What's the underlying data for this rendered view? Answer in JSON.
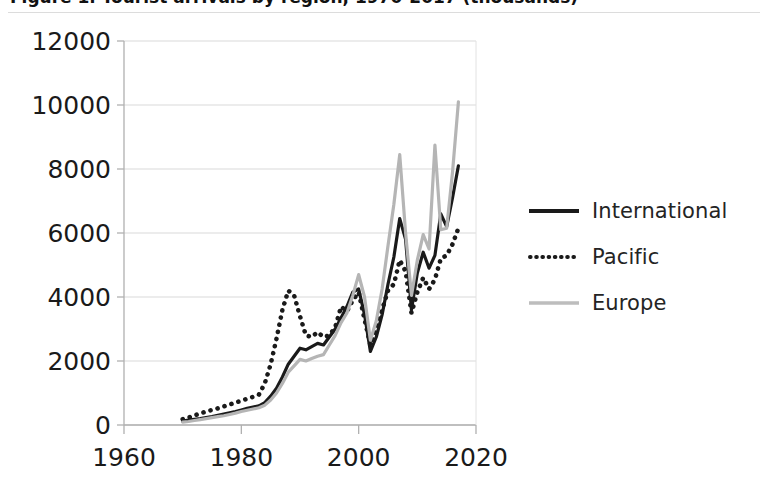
{
  "figure": {
    "title_clipped": "Figure 1. Tourist arrivals by region, 1970-2017 (thousands)",
    "background": "#ffffff"
  },
  "legend": {
    "position": "right",
    "items": [
      {
        "label": "International",
        "style": "solid",
        "color": "#1a1a1a",
        "icon": "solid-line-icon"
      },
      {
        "label": "Pacific",
        "style": "dotted",
        "color": "#1a1a1a",
        "icon": "dotted-line-icon"
      },
      {
        "label": "Europe",
        "style": "solid",
        "color": "#b5b5b5",
        "icon": "gray-line-icon"
      }
    ]
  },
  "axes": {
    "y_ticks": [
      "0",
      "2000",
      "4000",
      "6000",
      "8000",
      "10000",
      "12000"
    ],
    "x_ticks": [
      "1960",
      "1980",
      "2000",
      "2020"
    ],
    "y_tick_label_size": 25,
    "x_tick_label_size": 25,
    "grid": true,
    "grid_color": "#d9d9d9",
    "axis_color": "#b0b0b0"
  },
  "chart_data": {
    "type": "line",
    "title": "Figure 1. Tourist arrivals by region, 1970-2017 (thousands)",
    "xlabel": "",
    "ylabel": "",
    "xlim": [
      1960,
      2020
    ],
    "ylim": [
      0,
      12000
    ],
    "xticks": [
      1960,
      1980,
      2000,
      2020
    ],
    "yticks": [
      0,
      2000,
      4000,
      6000,
      8000,
      10000,
      12000
    ],
    "grid": "horizontal",
    "legend_position": "right",
    "x": [
      1970,
      1971,
      1972,
      1973,
      1974,
      1975,
      1976,
      1977,
      1978,
      1979,
      1980,
      1981,
      1982,
      1983,
      1984,
      1985,
      1986,
      1987,
      1988,
      1989,
      1990,
      1991,
      1992,
      1993,
      1994,
      1995,
      1996,
      1997,
      1998,
      1999,
      2000,
      2001,
      2002,
      2003,
      2004,
      2005,
      2006,
      2007,
      2008,
      2009,
      2010,
      2011,
      2012,
      2013,
      2014,
      2015,
      2016,
      2017
    ],
    "series": [
      {
        "name": "International",
        "style": "solid",
        "color": "#1a1a1a",
        "width": 3.2,
        "values": [
          120,
          150,
          180,
          200,
          230,
          260,
          300,
          340,
          380,
          420,
          470,
          520,
          560,
          600,
          700,
          900,
          1150,
          1500,
          1900,
          2150,
          2400,
          2350,
          2450,
          2550,
          2500,
          2750,
          3000,
          3350,
          3700,
          4150,
          4250,
          3450,
          2300,
          2750,
          3450,
          4400,
          5250,
          6450,
          5800,
          3600,
          4750,
          5400,
          4900,
          5300,
          6600,
          6200,
          7100,
          8100
        ]
      },
      {
        "name": "Pacific",
        "style": "dotted",
        "color": "#1a1a1a",
        "width": 3.2,
        "values": [
          180,
          230,
          300,
          360,
          420,
          470,
          520,
          580,
          640,
          700,
          760,
          820,
          880,
          950,
          1300,
          1900,
          2700,
          3600,
          4200,
          4050,
          3400,
          2800,
          2750,
          2900,
          2750,
          2800,
          3050,
          3700,
          3550,
          3900,
          4150,
          3300,
          2500,
          2950,
          3600,
          4200,
          4400,
          5150,
          4800,
          3500,
          4150,
          4600,
          4250,
          4550,
          5200,
          5300,
          5650,
          6150
        ]
      },
      {
        "name": "Europe",
        "style": "solid",
        "color": "#b5b5b5",
        "width": 3.2,
        "values": [
          90,
          110,
          140,
          170,
          200,
          230,
          260,
          290,
          330,
          370,
          420,
          460,
          500,
          540,
          620,
          780,
          1000,
          1300,
          1650,
          1850,
          2050,
          2000,
          2080,
          2150,
          2200,
          2500,
          2800,
          3200,
          3500,
          4050,
          4700,
          4000,
          2650,
          3250,
          4250,
          5600,
          6900,
          8450,
          6000,
          4050,
          5150,
          5950,
          5500,
          8750,
          6100,
          6150,
          7900,
          10100
        ]
      }
    ]
  }
}
